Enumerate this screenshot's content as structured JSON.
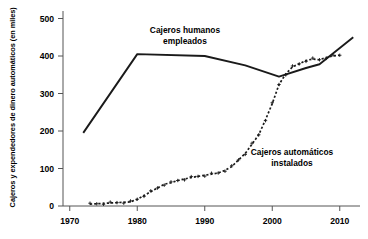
{
  "chart_data": {
    "type": "line",
    "title": "",
    "xlabel": "",
    "ylabel": "Cajeros y expendedores de dinero automáticos (en miles)",
    "xlim": [
      1969,
      2013
    ],
    "ylim": [
      0,
      520
    ],
    "xticks": [
      1970,
      1980,
      1990,
      2000,
      2010
    ],
    "xtick_labels": [
      "1970",
      "1980",
      "1990",
      "2000",
      "2010"
    ],
    "yticks": [
      0,
      100,
      200,
      300,
      400,
      500
    ],
    "ytick_labels": [
      "0",
      "100",
      "200",
      "300",
      "400",
      "500"
    ],
    "grid": false,
    "legend_position": "inline-annotations",
    "series": [
      {
        "name": "Cajeros humanos empleados",
        "style": "solid",
        "color": "#1a1a1a",
        "marker": "none",
        "annotation": "Cajeros humanos\nempleados",
        "points": [
          [
            1972,
            195
          ],
          [
            1980,
            405
          ],
          [
            1990,
            400
          ],
          [
            1996,
            375
          ],
          [
            2001,
            345
          ],
          [
            2005,
            368
          ],
          [
            2007,
            378
          ],
          [
            2012,
            450
          ]
        ]
      },
      {
        "name": "Cajeros automáticos instalados",
        "style": "dotted",
        "color": "#1a1a1a",
        "marker": "plus",
        "annotation": "Cajeros automáticos\ninstalados",
        "points": [
          [
            1973,
            5
          ],
          [
            1974,
            6
          ],
          [
            1975,
            7
          ],
          [
            1976,
            8
          ],
          [
            1977,
            9
          ],
          [
            1978,
            10
          ],
          [
            1979,
            11
          ],
          [
            1980,
            18
          ],
          [
            1981,
            28
          ],
          [
            1982,
            38
          ],
          [
            1983,
            48
          ],
          [
            1984,
            58
          ],
          [
            1985,
            62
          ],
          [
            1986,
            68
          ],
          [
            1987,
            72
          ],
          [
            1988,
            76
          ],
          [
            1989,
            79
          ],
          [
            1990,
            82
          ],
          [
            1991,
            85
          ],
          [
            1992,
            88
          ],
          [
            1993,
            95
          ],
          [
            1994,
            105
          ],
          [
            1995,
            123
          ],
          [
            1996,
            140
          ],
          [
            1997,
            165
          ],
          [
            1998,
            190
          ],
          [
            1999,
            230
          ],
          [
            2000,
            273
          ],
          [
            2001,
            324
          ],
          [
            2002,
            352
          ],
          [
            2003,
            371
          ],
          [
            2004,
            379
          ],
          [
            2005,
            388
          ],
          [
            2006,
            392
          ],
          [
            2007,
            390
          ],
          [
            2008,
            396
          ],
          [
            2009,
            400
          ],
          [
            2010,
            402
          ]
        ]
      }
    ],
    "annotations": [
      {
        "id": "annotation-human-tellers",
        "lines": [
          "Cajeros humanos",
          "empleados"
        ],
        "x_px": 185,
        "y_px": 33
      },
      {
        "id": "annotation-atms",
        "lines": [
          "Cajeros automáticos",
          "instalados"
        ],
        "x_px": 292,
        "y_px": 155
      }
    ]
  },
  "axes": {
    "y_axis_title": "Cajeros y expendedores de dinero automáticos (en miles)"
  }
}
